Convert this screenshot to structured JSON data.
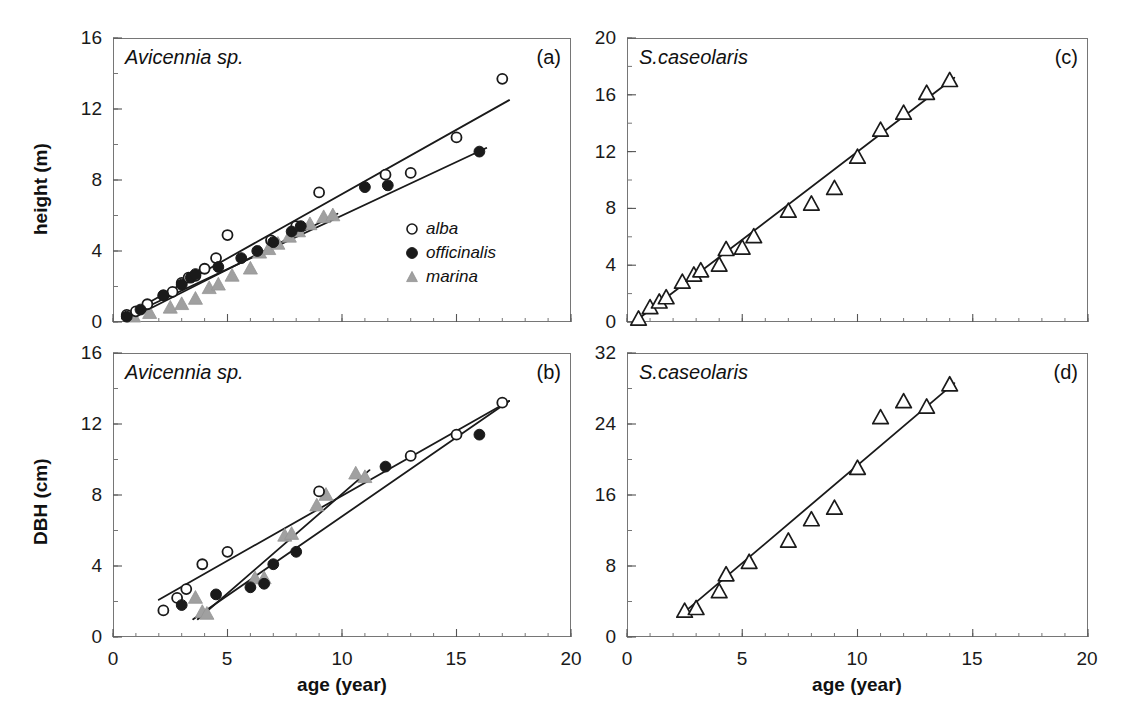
{
  "figure": {
    "background": "#ffffff",
    "marker_colors": {
      "alba_open_circle": "#ffffff",
      "alba_edge": "#1a1a1a",
      "officinalis_filled_circle": "#1a1a1a",
      "marina_triangle": "#a0a0a0",
      "caseolaris_open_triangle": "#ffffff",
      "caseolaris_edge": "#1a1a1a",
      "fit_line": "#1a1a1a",
      "frame": "#767676"
    }
  },
  "legend": {
    "position": "panel-a-lower-right",
    "entries": [
      {
        "marker": "open-circle",
        "label": "alba"
      },
      {
        "marker": "filled-circle",
        "label": "officinalis"
      },
      {
        "marker": "gray-triangle",
        "label": "marina"
      }
    ]
  },
  "chart_data": [
    {
      "id": "panel-a",
      "type": "scatter",
      "panel_letter": "(a)",
      "title": "Avicennia sp.",
      "xlabel": "",
      "ylabel": "height (m)",
      "xlim": [
        0,
        20
      ],
      "ylim": [
        0,
        16
      ],
      "xticks": [
        0,
        5,
        10,
        15,
        20
      ],
      "yticks": [
        0,
        4,
        8,
        12,
        16
      ],
      "xtick_labels": [
        "0",
        "5",
        "10",
        "15",
        "20"
      ],
      "ytick_labels": [
        "0",
        "4",
        "8",
        "12",
        "16"
      ],
      "minor_ticks": true,
      "grid": false,
      "legend_position": "lower right",
      "series": [
        {
          "name": "alba",
          "marker": "open-circle",
          "points": [
            [
              0.6,
              0.4
            ],
            [
              1.0,
              0.6
            ],
            [
              1.5,
              1.0
            ],
            [
              2.2,
              1.5
            ],
            [
              2.6,
              1.7
            ],
            [
              3.0,
              2.2
            ],
            [
              3.3,
              2.5
            ],
            [
              3.6,
              2.6
            ],
            [
              4.0,
              3.0
            ],
            [
              4.5,
              3.6
            ],
            [
              5.0,
              4.9
            ],
            [
              6.9,
              4.6
            ],
            [
              8.0,
              5.4
            ],
            [
              9.0,
              7.3
            ],
            [
              11.9,
              8.3
            ],
            [
              13.0,
              8.4
            ],
            [
              15.0,
              10.4
            ],
            [
              17.0,
              13.7
            ]
          ],
          "fit_line": {
            "x": [
              0.4,
              17.3
            ],
            "y": [
              0.25,
              12.5
            ]
          }
        },
        {
          "name": "officinalis",
          "marker": "filled-circle",
          "points": [
            [
              0.6,
              0.3
            ],
            [
              1.2,
              0.7
            ],
            [
              2.2,
              1.5
            ],
            [
              3.0,
              2.1
            ],
            [
              3.4,
              2.5
            ],
            [
              3.6,
              2.7
            ],
            [
              4.6,
              3.1
            ],
            [
              5.6,
              3.6
            ],
            [
              6.3,
              4.0
            ],
            [
              7.0,
              4.5
            ],
            [
              7.8,
              5.1
            ],
            [
              8.2,
              5.4
            ],
            [
              11.0,
              7.6
            ],
            [
              12.0,
              7.7
            ],
            [
              16.0,
              9.6
            ]
          ],
          "fit_line": {
            "x": [
              0.4,
              16.3
            ],
            "y": [
              0.2,
              9.8
            ]
          }
        },
        {
          "name": "marina",
          "marker": "gray-triangle",
          "points": [
            [
              0.9,
              0.3
            ],
            [
              1.6,
              0.5
            ],
            [
              2.5,
              0.8
            ],
            [
              3.0,
              1.0
            ],
            [
              3.6,
              1.3
            ],
            [
              4.2,
              1.9
            ],
            [
              4.6,
              2.1
            ],
            [
              5.2,
              2.6
            ],
            [
              6.0,
              3.0
            ],
            [
              6.4,
              3.9
            ],
            [
              6.8,
              4.1
            ],
            [
              7.2,
              4.4
            ],
            [
              7.7,
              4.8
            ],
            [
              8.1,
              5.1
            ],
            [
              8.6,
              5.5
            ],
            [
              9.2,
              5.9
            ],
            [
              9.6,
              6.0
            ]
          ],
          "fit_line": {
            "x": [
              1.0,
              9.8
            ],
            "y": [
              0.35,
              6.1
            ]
          }
        }
      ]
    },
    {
      "id": "panel-b",
      "type": "scatter",
      "panel_letter": "(b)",
      "title": "Avicennia sp.",
      "xlabel": "age (year)",
      "ylabel": "DBH (cm)",
      "xlim": [
        0,
        20
      ],
      "ylim": [
        0,
        16
      ],
      "xticks": [
        0,
        5,
        10,
        15,
        20
      ],
      "yticks": [
        0,
        4,
        8,
        12,
        16
      ],
      "xtick_labels": [
        "0",
        "5",
        "10",
        "15",
        "20"
      ],
      "ytick_labels": [
        "0",
        "4",
        "8",
        "12",
        "16"
      ],
      "minor_ticks": true,
      "grid": false,
      "series": [
        {
          "name": "alba",
          "marker": "open-circle",
          "points": [
            [
              2.2,
              1.5
            ],
            [
              2.8,
              2.2
            ],
            [
              3.2,
              2.7
            ],
            [
              3.9,
              4.1
            ],
            [
              5.0,
              4.8
            ],
            [
              9.0,
              8.2
            ],
            [
              13.0,
              10.2
            ],
            [
              15.0,
              11.4
            ],
            [
              17.0,
              13.2
            ]
          ],
          "fit_line": {
            "x": [
              2.0,
              17.3
            ],
            "y": [
              2.1,
              13.3
            ]
          }
        },
        {
          "name": "officinalis",
          "marker": "filled-circle",
          "points": [
            [
              3.0,
              1.8
            ],
            [
              4.5,
              2.4
            ],
            [
              6.0,
              2.8
            ],
            [
              6.6,
              3.0
            ],
            [
              7.0,
              4.1
            ],
            [
              8.0,
              4.8
            ],
            [
              11.9,
              9.6
            ],
            [
              16.0,
              11.4
            ]
          ],
          "fit_line": {
            "x": [
              3.5,
              17.3
            ],
            "y": [
              1.0,
              13.3
            ]
          }
        },
        {
          "name": "marina",
          "marker": "gray-triangle",
          "points": [
            [
              3.6,
              2.2
            ],
            [
              3.9,
              1.4
            ],
            [
              4.1,
              1.3
            ],
            [
              6.2,
              3.3
            ],
            [
              6.6,
              3.3
            ],
            [
              7.5,
              5.7
            ],
            [
              7.8,
              5.8
            ],
            [
              8.9,
              7.4
            ],
            [
              9.3,
              8.0
            ],
            [
              10.6,
              9.2
            ],
            [
              11.0,
              9.0
            ]
          ],
          "fit_line": {
            "x": [
              3.7,
              11.2
            ],
            "y": [
              1.0,
              9.4
            ]
          }
        }
      ]
    },
    {
      "id": "panel-c",
      "type": "scatter",
      "panel_letter": "(c)",
      "title": "S.caseolaris",
      "xlabel": "",
      "ylabel": "",
      "xlim": [
        0,
        20
      ],
      "ylim": [
        0,
        20
      ],
      "xticks": [
        0,
        5,
        10,
        15,
        20
      ],
      "yticks": [
        0,
        4,
        8,
        12,
        16,
        20
      ],
      "xtick_labels": [
        "0",
        "5",
        "10",
        "15",
        "20"
      ],
      "ytick_labels": [
        "0",
        "4",
        "8",
        "12",
        "16",
        "20"
      ],
      "minor_ticks": true,
      "grid": false,
      "series": [
        {
          "name": "S. caseolaris",
          "marker": "open-triangle",
          "points": [
            [
              0.5,
              0.2
            ],
            [
              1.0,
              1.0
            ],
            [
              1.4,
              1.4
            ],
            [
              1.7,
              1.7
            ],
            [
              2.4,
              2.8
            ],
            [
              2.9,
              3.3
            ],
            [
              3.2,
              3.6
            ],
            [
              4.0,
              4.0
            ],
            [
              4.3,
              5.1
            ],
            [
              5.0,
              5.2
            ],
            [
              5.5,
              6.0
            ],
            [
              7.0,
              7.8
            ],
            [
              8.0,
              8.3
            ],
            [
              9.0,
              9.4
            ],
            [
              10.0,
              11.6
            ],
            [
              11.0,
              13.5
            ],
            [
              12.0,
              14.7
            ],
            [
              13.0,
              16.1
            ],
            [
              14.0,
              17.0
            ]
          ],
          "fit_line": {
            "x": [
              0.4,
              14.2
            ],
            "y": [
              0.1,
              17.2
            ]
          }
        }
      ]
    },
    {
      "id": "panel-d",
      "type": "scatter",
      "panel_letter": "(d)",
      "title": "S.caseolaris",
      "xlabel": "age (year)",
      "ylabel": "",
      "xlim": [
        0,
        20
      ],
      "ylim": [
        0,
        32
      ],
      "xticks": [
        0,
        5,
        10,
        15,
        20
      ],
      "yticks": [
        0,
        8,
        16,
        24,
        32
      ],
      "xtick_labels": [
        "0",
        "5",
        "10",
        "15",
        "20"
      ],
      "ytick_labels": [
        "0",
        "8",
        "16",
        "24",
        "32"
      ],
      "minor_ticks": true,
      "grid": false,
      "series": [
        {
          "name": "S. caseolaris",
          "marker": "open-triangle",
          "points": [
            [
              2.5,
              2.9
            ],
            [
              3.0,
              3.2
            ],
            [
              4.0,
              5.1
            ],
            [
              4.3,
              7.0
            ],
            [
              5.3,
              8.4
            ],
            [
              7.0,
              10.8
            ],
            [
              8.0,
              13.2
            ],
            [
              9.0,
              14.5
            ],
            [
              10.0,
              19.0
            ],
            [
              11.0,
              24.7
            ],
            [
              12.0,
              26.5
            ],
            [
              13.0,
              25.9
            ],
            [
              14.0,
              28.4
            ]
          ],
          "fit_line": {
            "x": [
              2.4,
              14.2
            ],
            "y": [
              2.6,
              28.6
            ]
          }
        }
      ]
    }
  ]
}
